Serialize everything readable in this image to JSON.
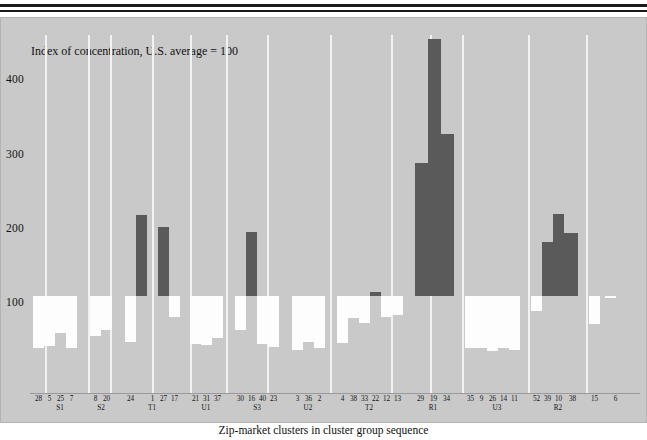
{
  "figure": {
    "y_axis_caption": "Index of concentration, U.S. average = 100",
    "x_axis_title": "Zip-market clusters in cluster group sequence",
    "y_ticks": [
      "400",
      "300",
      "200",
      "100"
    ],
    "colors": {
      "panel_background": "#c9c9c9",
      "below_average_bar": "#fdfdfd",
      "above_average_bar": "#5a5a5a",
      "gridline": "#f2f2f2",
      "rule": "#1a1a1a"
    }
  },
  "chart_data": {
    "type": "bar",
    "title": "Index of concentration, U.S. average = 100",
    "xlabel": "Zip-market clusters in cluster group sequence",
    "ylabel": "Index of concentration, U.S. average = 100",
    "ylim": [
      0,
      460
    ],
    "baseline": 100,
    "yticks": [
      100,
      200,
      300,
      400
    ],
    "grid": false,
    "legend": "none",
    "note": "Bars are drawn from the 100 reference line; values below 100 are white, values above 100 are dark grey.",
    "group_labels": [
      "S1",
      "S2",
      "T1",
      "U1",
      "S3",
      "U2",
      "T2",
      "R1",
      "U3",
      "R2"
    ],
    "groups": [
      {
        "label": "S1",
        "categories": [
          "28",
          "5",
          "25",
          "7"
        ]
      },
      {
        "label": "S2",
        "categories": [
          "8",
          "20"
        ]
      },
      {
        "label": "T1",
        "categories": [
          "24",
          "1",
          "27",
          "17"
        ]
      },
      {
        "label": "U1",
        "categories": [
          "21",
          "31",
          "37"
        ]
      },
      {
        "label": "S3",
        "categories": [
          "30",
          "16",
          "40",
          "23"
        ]
      },
      {
        "label": "U2",
        "categories": [
          "3",
          "36",
          "2"
        ]
      },
      {
        "label": "T2",
        "categories": [
          "4",
          "38",
          "33",
          "22",
          "12",
          "13"
        ]
      },
      {
        "label": "R1",
        "categories": [
          "29",
          "19",
          "34"
        ]
      },
      {
        "label": "U3",
        "categories": [
          "35",
          "9",
          "26",
          "14",
          "11"
        ]
      },
      {
        "label": "R2",
        "categories": [
          "52",
          "39",
          "10",
          "38",
          "15",
          "6"
        ]
      }
    ],
    "categories": [
      "28",
      "5",
      "25",
      "7",
      "8",
      "20",
      "24",
      "1",
      "27",
      "17",
      "21",
      "31",
      "37",
      "30",
      "16",
      "40",
      "23",
      "3",
      "36",
      "2",
      "4",
      "38",
      "33",
      "22",
      "12",
      "13",
      "29",
      "19",
      "34",
      "35",
      "9",
      "26",
      "14",
      "11",
      "52",
      "39",
      "10",
      "38",
      "15",
      "6"
    ],
    "values": [
      30,
      33,
      50,
      30,
      46,
      55,
      38,
      209,
      193,
      72,
      35,
      34,
      44,
      55,
      186,
      36,
      32,
      27,
      38,
      30,
      37,
      70,
      64,
      105,
      72,
      74,
      279,
      445,
      317,
      30,
      30,
      26,
      30,
      27,
      80,
      172,
      210,
      185,
      63,
      98
    ]
  },
  "bars": [
    {
      "cat": "28",
      "group": "S1",
      "value": 30,
      "x": 3,
      "w": 11,
      "dir": "down"
    },
    {
      "cat": "5",
      "group": "S1",
      "value": 33,
      "x": 14,
      "w": 11,
      "dir": "down"
    },
    {
      "cat": "25",
      "group": "S1",
      "value": 50,
      "x": 25,
      "w": 11,
      "dir": "down"
    },
    {
      "cat": "7",
      "group": "S1",
      "value": 30,
      "x": 36,
      "w": 11,
      "dir": "down"
    },
    {
      "cat": "8",
      "group": "S2",
      "value": 46,
      "x": 60,
      "w": 11,
      "dir": "down"
    },
    {
      "cat": "20",
      "group": "S2",
      "value": 55,
      "x": 71,
      "w": 11,
      "dir": "down"
    },
    {
      "cat": "24",
      "group": "T1",
      "value": 38,
      "x": 95,
      "w": 11,
      "dir": "down"
    },
    {
      "cat": "1",
      "group": "T1",
      "value": 209,
      "x": 106,
      "w": 11,
      "dir": "up"
    },
    {
      "cat": "27",
      "group": "T1",
      "value": 193,
      "x": 128,
      "w": 11,
      "dir": "up"
    },
    {
      "cat": "17",
      "group": "T1",
      "value": 72,
      "x": 139,
      "w": 11,
      "dir": "down"
    },
    {
      "cat": "21",
      "group": "U1",
      "value": 35,
      "x": 160,
      "w": 11,
      "dir": "down"
    },
    {
      "cat": "31",
      "group": "U1",
      "value": 34,
      "x": 171,
      "w": 11,
      "dir": "down"
    },
    {
      "cat": "37",
      "group": "U1",
      "value": 44,
      "x": 182,
      "w": 11,
      "dir": "down"
    },
    {
      "cat": "30",
      "group": "S3",
      "value": 55,
      "x": 205,
      "w": 11,
      "dir": "down"
    },
    {
      "cat": "16",
      "group": "S3",
      "value": 186,
      "x": 216,
      "w": 11,
      "dir": "up"
    },
    {
      "cat": "40",
      "group": "S3",
      "value": 36,
      "x": 227,
      "w": 11,
      "dir": "down"
    },
    {
      "cat": "23",
      "group": "S3",
      "value": 32,
      "x": 238,
      "w": 11,
      "dir": "down"
    },
    {
      "cat": "3",
      "group": "U2",
      "value": 27,
      "x": 262,
      "w": 11,
      "dir": "down"
    },
    {
      "cat": "36",
      "group": "U2",
      "value": 38,
      "x": 273,
      "w": 11,
      "dir": "down"
    },
    {
      "cat": "2",
      "group": "U2",
      "value": 30,
      "x": 284,
      "w": 11,
      "dir": "down"
    },
    {
      "cat": "4",
      "group": "T2",
      "value": 37,
      "x": 307,
      "w": 11,
      "dir": "down"
    },
    {
      "cat": "38",
      "group": "T2",
      "value": 70,
      "x": 318,
      "w": 11,
      "dir": "down"
    },
    {
      "cat": "33",
      "group": "T2",
      "value": 64,
      "x": 329,
      "w": 11,
      "dir": "down"
    },
    {
      "cat": "22",
      "group": "T2",
      "value": 105,
      "x": 340,
      "w": 11,
      "dir": "up"
    },
    {
      "cat": "12",
      "group": "T2",
      "value": 72,
      "x": 351,
      "w": 11,
      "dir": "down"
    },
    {
      "cat": "13",
      "group": "T2",
      "value": 74,
      "x": 362,
      "w": 11,
      "dir": "down"
    },
    {
      "cat": "29",
      "group": "R1",
      "value": 279,
      "x": 385,
      "w": 13,
      "dir": "up"
    },
    {
      "cat": "19",
      "group": "R1",
      "value": 445,
      "x": 398,
      "w": 13,
      "dir": "up"
    },
    {
      "cat": "34",
      "group": "R1",
      "value": 317,
      "x": 411,
      "w": 13,
      "dir": "up"
    },
    {
      "cat": "35",
      "group": "U3",
      "value": 30,
      "x": 435,
      "w": 11,
      "dir": "down"
    },
    {
      "cat": "9",
      "group": "U3",
      "value": 30,
      "x": 446,
      "w": 11,
      "dir": "down"
    },
    {
      "cat": "26",
      "group": "U3",
      "value": 26,
      "x": 457,
      "w": 11,
      "dir": "down"
    },
    {
      "cat": "14",
      "group": "U3",
      "value": 30,
      "x": 468,
      "w": 11,
      "dir": "down"
    },
    {
      "cat": "11",
      "group": "U3",
      "value": 27,
      "x": 479,
      "w": 11,
      "dir": "down"
    },
    {
      "cat": "52",
      "group": "R2",
      "value": 80,
      "x": 501,
      "w": 11,
      "dir": "down"
    },
    {
      "cat": "39",
      "group": "R2",
      "value": 172,
      "x": 512,
      "w": 11,
      "dir": "up"
    },
    {
      "cat": "10",
      "group": "R2",
      "value": 210,
      "x": 523,
      "w": 11,
      "dir": "up"
    },
    {
      "cat": "38",
      "group": "R2",
      "value": 185,
      "x": 534,
      "w": 14,
      "dir": "up"
    },
    {
      "cat": "15",
      "group": "R2",
      "value": 63,
      "x": 559,
      "w": 11,
      "dir": "down"
    },
    {
      "cat": "6",
      "group": "R2",
      "value": 98,
      "x": 575,
      "w": 11,
      "dir": "down"
    }
  ],
  "gridlines_x": [
    15,
    58,
    80,
    122,
    160,
    196,
    237,
    300,
    361,
    400,
    432,
    498,
    556
  ],
  "tick_positions": [
    {
      "label": "28",
      "x": 3
    },
    {
      "label": "5",
      "x": 14
    },
    {
      "label": "25",
      "x": 25
    },
    {
      "label": "7",
      "x": 36
    },
    {
      "label": "8",
      "x": 60
    },
    {
      "label": "20",
      "x": 71
    },
    {
      "label": "24",
      "x": 95
    },
    {
      "label": "1",
      "x": 117
    },
    {
      "label": "27",
      "x": 128
    },
    {
      "label": "17",
      "x": 139
    },
    {
      "label": "21",
      "x": 160
    },
    {
      "label": "31",
      "x": 171
    },
    {
      "label": "37",
      "x": 182
    },
    {
      "label": "30",
      "x": 205
    },
    {
      "label": "16",
      "x": 216
    },
    {
      "label": "40",
      "x": 227
    },
    {
      "label": "23",
      "x": 238
    },
    {
      "label": "3",
      "x": 262
    },
    {
      "label": "36",
      "x": 273
    },
    {
      "label": "2",
      "x": 284
    },
    {
      "label": "4",
      "x": 307
    },
    {
      "label": "38",
      "x": 318
    },
    {
      "label": "33",
      "x": 329
    },
    {
      "label": "22",
      "x": 340
    },
    {
      "label": "12",
      "x": 351
    },
    {
      "label": "13",
      "x": 362
    },
    {
      "label": "29",
      "x": 385
    },
    {
      "label": "19",
      "x": 398
    },
    {
      "label": "34",
      "x": 411
    },
    {
      "label": "35",
      "x": 435
    },
    {
      "label": "9",
      "x": 446
    },
    {
      "label": "26",
      "x": 457
    },
    {
      "label": "14",
      "x": 468
    },
    {
      "label": "11",
      "x": 479
    },
    {
      "label": "52",
      "x": 501
    },
    {
      "label": "39",
      "x": 512
    },
    {
      "label": "10",
      "x": 523
    },
    {
      "label": "38",
      "x": 537
    },
    {
      "label": "15",
      "x": 559
    },
    {
      "label": "6",
      "x": 580
    }
  ],
  "group_positions": [
    {
      "label": "S1",
      "x": 25
    },
    {
      "label": "S2",
      "x": 66
    },
    {
      "label": "T1",
      "x": 117
    },
    {
      "label": "U1",
      "x": 171
    },
    {
      "label": "S3",
      "x": 222
    },
    {
      "label": "U2",
      "x": 273
    },
    {
      "label": "T2",
      "x": 334
    },
    {
      "label": "R1",
      "x": 398
    },
    {
      "label": "U3",
      "x": 462
    },
    {
      "label": "R2",
      "x": 523
    }
  ],
  "ytick_positions": [
    {
      "label": "400",
      "y": 56
    },
    {
      "label": "300",
      "y": 131
    },
    {
      "label": "200",
      "y": 205
    },
    {
      "label": "100",
      "y": 279
    }
  ]
}
